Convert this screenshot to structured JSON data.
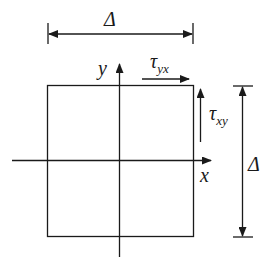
{
  "diagram": {
    "title": "",
    "labels": {
      "top_dimension": "Δ",
      "right_dimension": "Δ",
      "y_axis": "y",
      "x_axis": "x",
      "shear_yx_symbol": "τ",
      "shear_yx_subscript": "yx",
      "shear_xy_symbol": "τ",
      "shear_xy_subscript": "xy"
    },
    "colors": {
      "stroke": "#1a1a1a",
      "background": "#ffffff"
    }
  }
}
